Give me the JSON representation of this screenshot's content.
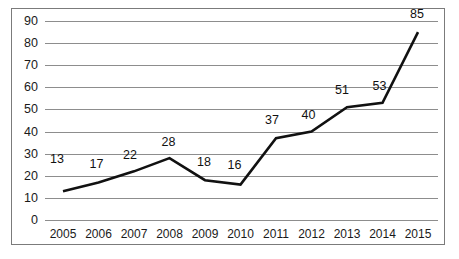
{
  "chart_data": {
    "type": "line",
    "title": "",
    "subtitle": "",
    "xlabel": "",
    "ylabel": "",
    "categories": [
      "2005",
      "2006",
      "2007",
      "2008",
      "2009",
      "2010",
      "2011",
      "2012",
      "2013",
      "2014",
      "2015"
    ],
    "values": [
      13,
      17,
      22,
      28,
      18,
      16,
      37,
      40,
      51,
      53,
      85
    ],
    "data_labels": [
      "13",
      "17",
      "22",
      "28",
      "18",
      "16",
      "37",
      "40",
      "51",
      "53",
      "85"
    ],
    "ylim": [
      0,
      90
    ],
    "ytick_values": [
      0,
      10,
      20,
      30,
      40,
      50,
      60,
      70,
      80,
      90
    ],
    "ytick_labels": [
      "0",
      "10",
      "20",
      "30",
      "40",
      "50",
      "60",
      "70",
      "80",
      "90"
    ],
    "grid": true,
    "grid_axis": "y",
    "legend": false,
    "legend_position": "none",
    "annotations": [],
    "series_color": "#111111",
    "grid_color": "#8d8d8d",
    "border_color": "#7b7b7b",
    "background_color": "#ffffff",
    "text_color": "#1a1a1a"
  }
}
